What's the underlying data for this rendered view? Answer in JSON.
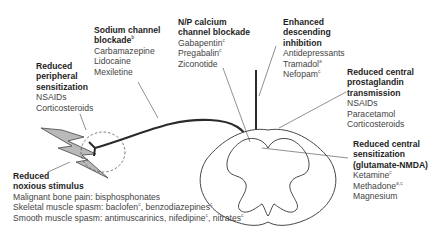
{
  "diagram": {
    "colors": {
      "text": "#3a3a3a",
      "title": "#1e1e1e",
      "lines": "#333333",
      "lightning_fill": "#b8b8b8",
      "dashed_circle": "#555555"
    },
    "blocks": {
      "sodium": {
        "title_1": "Sodium channel",
        "title_2": "blockade",
        "title_sup": "b",
        "items": [
          "Carbamazepine",
          "Lidocaine",
          "Mexiletine"
        ]
      },
      "calcium": {
        "title_1": "N/P calcium",
        "title_2": "channel blockade",
        "items": [
          {
            "name": "Gabapentin",
            "sup": "c"
          },
          {
            "name": "Pregabalin",
            "sup": "c"
          },
          {
            "name": "Ziconotide",
            "sup": ""
          }
        ]
      },
      "descending": {
        "title_1": "Enhanced",
        "title_2": "descending",
        "title_3": "inhibition",
        "items": [
          {
            "name": "Antidepressants",
            "sup": ""
          },
          {
            "name": "Tramadol",
            "sup": "a"
          },
          {
            "name": "Nefopam",
            "sup": "c"
          }
        ]
      },
      "peripheral": {
        "title_1": "Reduced",
        "title_2": "peripheral",
        "title_3": "sensitization",
        "items": [
          "NSAIDs",
          "Corticosteroids"
        ]
      },
      "prostaglandin": {
        "title_1": "Reduced central",
        "title_2": "prostaglandin",
        "title_3": "transmission",
        "items": [
          "NSAIDs",
          "Paracetamol",
          "Corticosteroids"
        ]
      },
      "central_sensitization": {
        "title_1": "Reduced central",
        "title_2": "sensitization",
        "title_3": "(glutamate-NMDA)",
        "items": [
          {
            "name": "Ketamine",
            "sup": "c"
          },
          {
            "name": "Methadone",
            "sup": "a,c"
          },
          {
            "name": "Magnesium",
            "sup": ""
          }
        ]
      },
      "noxious": {
        "title_1": "Reduced",
        "title_2": "noxious stimulus",
        "line_1": "Malignant bone pain: bisphosphonates",
        "line_2_a": "Skeletal muscle spasm: baclofen",
        "line_2_a_sup": "c",
        "line_2_b": ", benzodiazepines",
        "line_2_b_sup": "c",
        "line_3_a": "Smooth muscle spasm: antimuscarinics, nifedipine",
        "line_3_a_sup": "c",
        "line_3_b": ", nitrates",
        "line_3_b_sup": "c"
      }
    }
  }
}
